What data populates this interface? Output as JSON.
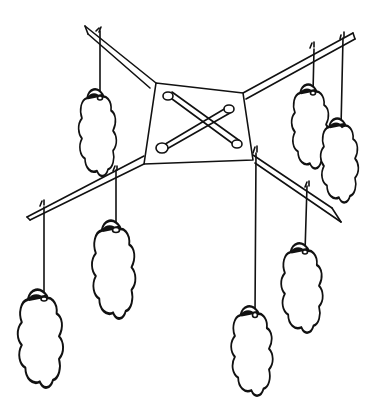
{
  "illustration": {
    "subject": "hanging mobile with crossed sticks and cloud-shaped leaves",
    "background": "#ffffff",
    "stroke_color": "#111111",
    "leaf_count": 7
  }
}
